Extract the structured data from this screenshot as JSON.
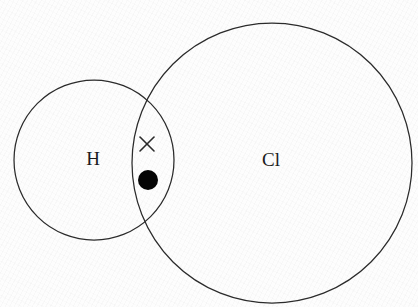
{
  "figure": {
    "type": "dot-and-cross-diagram",
    "width": 418,
    "height": 307,
    "background_color": "#fdfdfd",
    "stroke_color": "#2b2b2b",
    "text_color": "#1c1c1c"
  },
  "shells": [
    {
      "id": "hydrogen-shell",
      "atom": "H",
      "cx": 94,
      "cy": 160,
      "r": 80,
      "stroke_width": 1.25
    },
    {
      "id": "chlorine-shell",
      "atom": "Cl",
      "cx": 272,
      "cy": 163,
      "r": 140,
      "stroke_width": 1.25
    }
  ],
  "labels": [
    {
      "id": "hydrogen-label",
      "text": "H",
      "x": 93,
      "y": 158,
      "font_size": 19
    },
    {
      "id": "chlorine-label",
      "text": "Cl",
      "x": 271,
      "y": 159,
      "font_size": 19
    }
  ],
  "electrons": [
    {
      "id": "cross-electron",
      "marker": "cross",
      "owner": "H",
      "cx": 147,
      "cy": 144,
      "size": 14,
      "stroke_width": 1.6,
      "color": "#2b2b2b"
    },
    {
      "id": "dot-electron",
      "marker": "dot",
      "owner": "Cl",
      "cx": 148,
      "cy": 180,
      "r": 10,
      "color": "#050505"
    }
  ],
  "chart_data": {
    "type": "diagram",
    "subtitle": "",
    "xlabel": "",
    "ylabel": "",
    "categories": [
      "H",
      "Cl"
    ],
    "series": [
      {
        "name": "shell radius (px)",
        "values": [
          80,
          140
        ]
      },
      {
        "name": "electrons shown in overlap",
        "values": [
          1,
          1
        ]
      }
    ],
    "annotations": [
      "H",
      "Cl",
      "cross",
      "dot"
    ],
    "legend": [
      {
        "marker": "cross",
        "label": "H"
      },
      {
        "marker": "dot",
        "label": "Cl"
      }
    ],
    "legend_position": "none",
    "grid": false
  }
}
